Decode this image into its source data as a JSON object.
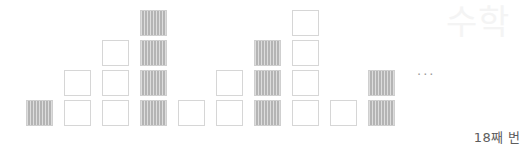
{
  "figure": {
    "ellipsis": "···",
    "caption": "18째 번",
    "watermark": "수학",
    "colors": {
      "empty_border": "#d6d6d6",
      "empty_fill": "#ffffff",
      "filled_border": "#cfcfcf",
      "filled_fill": "#b4b4b4",
      "caption_text": "#5d5d5d",
      "ellipsis_text": "#9a9a9a",
      "background": "#ffffff"
    }
  },
  "chart_data": {
    "type": "bar",
    "title": "",
    "subtitle": "",
    "xlabel": "",
    "ylabel": "",
    "grid": false,
    "legend": null,
    "ylim": [
      0,
      4
    ],
    "categories": [
      "1",
      "2",
      "3",
      "4",
      "5",
      "6",
      "7",
      "8",
      "9",
      "10"
    ],
    "values": [
      1,
      2,
      3,
      4,
      1,
      2,
      3,
      4,
      1,
      2
    ],
    "series": [
      {
        "name": "squares-per-column",
        "values": [
          1,
          2,
          3,
          4,
          1,
          2,
          3,
          4,
          1,
          2
        ]
      }
    ],
    "annotations": [
      "···",
      "18째 번"
    ],
    "columns": [
      {
        "index": 1,
        "count": 1,
        "style": "filled"
      },
      {
        "index": 2,
        "count": 2,
        "style": "empty"
      },
      {
        "index": 3,
        "count": 3,
        "style": "empty"
      },
      {
        "index": 4,
        "count": 4,
        "style": "filled"
      },
      {
        "index": 5,
        "count": 1,
        "style": "empty"
      },
      {
        "index": 6,
        "count": 2,
        "style": "empty"
      },
      {
        "index": 7,
        "count": 3,
        "style": "filled"
      },
      {
        "index": 8,
        "count": 4,
        "style": "empty"
      },
      {
        "index": 9,
        "count": 1,
        "style": "empty"
      },
      {
        "index": 10,
        "count": 2,
        "style": "filled"
      }
    ]
  }
}
